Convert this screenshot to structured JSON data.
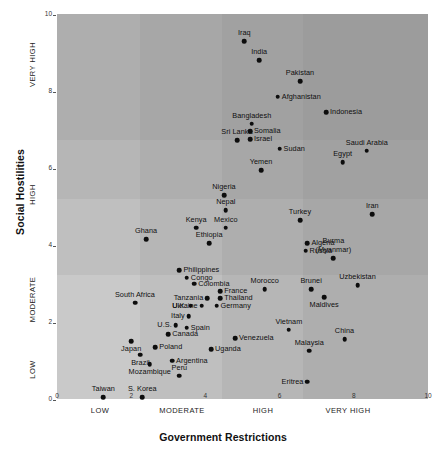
{
  "chart_data": {
    "type": "scatter",
    "title": "",
    "xlabel": "Government Restrictions",
    "ylabel": "Social Hostilities",
    "xlim": [
      0,
      10
    ],
    "ylim": [
      0,
      10
    ],
    "xticks": [
      "0",
      "2",
      "4",
      "6",
      "8",
      "10"
    ],
    "yticks": [
      "0",
      "2",
      "4",
      "6",
      "8",
      "10"
    ],
    "grid": false,
    "legend": "none",
    "x_categories": [
      "LOW",
      "MODERATE",
      "HIGH",
      "VERY HIGH"
    ],
    "y_categories": [
      "LOW",
      "MODERATE",
      "HIGH",
      "VERY HIGH"
    ],
    "points": [
      {
        "label": "Iraq",
        "x": 5.05,
        "y": 9.3,
        "pos": "c"
      },
      {
        "label": "India",
        "x": 5.45,
        "y": 8.8,
        "pos": "c"
      },
      {
        "label": "Pakistan",
        "x": 6.55,
        "y": 8.25,
        "pos": "c"
      },
      {
        "label": "Afghanistan",
        "x": 5.95,
        "y": 7.85,
        "pos": "l"
      },
      {
        "label": "Indonesia",
        "x": 7.25,
        "y": 7.45,
        "pos": "l"
      },
      {
        "label": "Bangladesh",
        "x": 5.25,
        "y": 7.15,
        "pos": "c"
      },
      {
        "label": "Somalia",
        "x": 5.2,
        "y": 6.95,
        "pos": "l"
      },
      {
        "label": "Israel",
        "x": 5.2,
        "y": 6.75,
        "pos": "l"
      },
      {
        "label": "Sri Lanka",
        "x": 4.85,
        "y": 6.72,
        "pos": "c"
      },
      {
        "label": "Sudan",
        "x": 6.0,
        "y": 6.5,
        "pos": "l"
      },
      {
        "label": "Saudi Arabia",
        "x": 8.35,
        "y": 6.45,
        "pos": "c"
      },
      {
        "label": "Egypt",
        "x": 7.7,
        "y": 6.15,
        "pos": "c"
      },
      {
        "label": "Yemen",
        "x": 5.5,
        "y": 5.95,
        "pos": "c"
      },
      {
        "label": "Nigeria",
        "x": 4.5,
        "y": 5.3,
        "pos": "c"
      },
      {
        "label": "Nepal",
        "x": 4.55,
        "y": 4.9,
        "pos": "c"
      },
      {
        "label": "Turkey",
        "x": 6.55,
        "y": 4.65,
        "pos": "c"
      },
      {
        "label": "Iran",
        "x": 8.5,
        "y": 4.8,
        "pos": "c"
      },
      {
        "label": "Kenya",
        "x": 3.75,
        "y": 4.45,
        "pos": "c"
      },
      {
        "label": "Mexico",
        "x": 4.55,
        "y": 4.45,
        "pos": "c"
      },
      {
        "label": "Algeria",
        "x": 6.75,
        "y": 4.05,
        "pos": "l"
      },
      {
        "label": "Ethiopia",
        "x": 4.1,
        "y": 4.05,
        "pos": "c"
      },
      {
        "label": "Ghana",
        "x": 2.4,
        "y": 4.15,
        "pos": "c"
      },
      {
        "label": "Russia",
        "x": 6.7,
        "y": 3.85,
        "pos": "l"
      },
      {
        "label": "Burma (Myanmar)",
        "x": 7.45,
        "y": 3.65,
        "pos": "c"
      },
      {
        "label": "Philippines",
        "x": 3.3,
        "y": 3.35,
        "pos": "l"
      },
      {
        "label": "Congo",
        "x": 3.5,
        "y": 3.15,
        "pos": "l"
      },
      {
        "label": "Colombia",
        "x": 3.7,
        "y": 3.0,
        "pos": "l"
      },
      {
        "label": "Uzbekistan",
        "x": 8.1,
        "y": 2.95,
        "pos": "c"
      },
      {
        "label": "Morocco",
        "x": 5.6,
        "y": 2.85,
        "pos": "c"
      },
      {
        "label": "Brunei",
        "x": 6.85,
        "y": 2.85,
        "pos": "c"
      },
      {
        "label": "France",
        "x": 4.4,
        "y": 2.8,
        "pos": "l"
      },
      {
        "label": "Tanzania",
        "x": 4.05,
        "y": 2.62,
        "pos": "r"
      },
      {
        "label": "Thailand",
        "x": 4.4,
        "y": 2.62,
        "pos": "l"
      },
      {
        "label": "Maldives",
        "x": 7.2,
        "y": 2.65,
        "pos": "c2"
      },
      {
        "label": "South Africa",
        "x": 2.1,
        "y": 2.5,
        "pos": "c"
      },
      {
        "label": "U.K.",
        "x": 3.6,
        "y": 2.42,
        "pos": "r"
      },
      {
        "label": "Ukraine",
        "x": 3.9,
        "y": 2.42,
        "pos": "r"
      },
      {
        "label": "Germany",
        "x": 4.3,
        "y": 2.42,
        "pos": "l"
      },
      {
        "label": "Italy",
        "x": 3.55,
        "y": 2.15,
        "pos": "r"
      },
      {
        "label": "U.S.",
        "x": 3.2,
        "y": 1.92,
        "pos": "r"
      },
      {
        "label": "Spain",
        "x": 3.5,
        "y": 1.85,
        "pos": "l"
      },
      {
        "label": "Vietnam",
        "x": 6.25,
        "y": 1.8,
        "pos": "c"
      },
      {
        "label": "Canada",
        "x": 3.0,
        "y": 1.68,
        "pos": "l"
      },
      {
        "label": "Venezuela",
        "x": 4.8,
        "y": 1.58,
        "pos": "l"
      },
      {
        "label": "China",
        "x": 7.75,
        "y": 1.55,
        "pos": "c"
      },
      {
        "label": "Japan",
        "x": 2.0,
        "y": 1.5,
        "pos": "c2"
      },
      {
        "label": "Poland",
        "x": 2.65,
        "y": 1.35,
        "pos": "l"
      },
      {
        "label": "Uganda",
        "x": 4.15,
        "y": 1.3,
        "pos": "l"
      },
      {
        "label": "Malaysia",
        "x": 6.8,
        "y": 1.25,
        "pos": "c"
      },
      {
        "label": "Brazil",
        "x": 2.25,
        "y": 1.15,
        "pos": "c2"
      },
      {
        "label": "Argentina",
        "x": 3.1,
        "y": 1.0,
        "pos": "l"
      },
      {
        "label": "Mozambique",
        "x": 2.5,
        "y": 0.9,
        "pos": "c2"
      },
      {
        "label": "Peru",
        "x": 3.3,
        "y": 0.6,
        "pos": "c"
      },
      {
        "label": "Eritrea",
        "x": 6.75,
        "y": 0.45,
        "pos": "r"
      },
      {
        "label": "Taiwan",
        "x": 1.25,
        "y": 0.05,
        "pos": "c"
      },
      {
        "label": "S. Korea",
        "x": 2.3,
        "y": 0.05,
        "pos": "c"
      }
    ]
  },
  "shading": {
    "base": "#c9c9c9",
    "note": "overlapping translucent quadrant bands, darker toward upper-right"
  }
}
